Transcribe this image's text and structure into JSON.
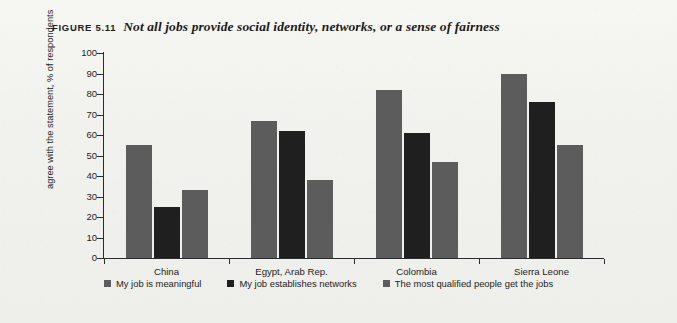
{
  "figure": {
    "label": "FIGURE 5.11",
    "title": "Not all jobs provide social identity, networks, or a sense of fairness"
  },
  "colors": {
    "series_gray": "#5c5c5c",
    "series_black": "#1f1f1f",
    "axis": "#2b2b2b",
    "text": "#1d1d1d",
    "background": "#f1f1ee"
  },
  "chart_data": {
    "type": "bar",
    "title": "Not all jobs provide social identity, networks, or a sense of fairness",
    "xlabel": "",
    "ylabel": "agree with the statement, % of respondents",
    "ylim": [
      0,
      100
    ],
    "ytick_step": 10,
    "yticks": [
      0,
      10,
      20,
      30,
      40,
      50,
      60,
      70,
      80,
      90,
      100
    ],
    "ytick_labels": [
      "0",
      "10",
      "20",
      "30",
      "40",
      "50",
      "60",
      "70",
      "80",
      "90",
      "100"
    ],
    "grid": false,
    "legend_position": "bottom",
    "categories": [
      "China",
      "Egypt, Arab Rep.",
      "Colombia",
      "Sierra Leone"
    ],
    "series": [
      {
        "name": "My job is meaningful",
        "color": "#5c5c5c",
        "values": [
          55,
          67,
          82,
          90
        ]
      },
      {
        "name": "My job establishes networks",
        "color": "#1f1f1f",
        "values": [
          25,
          62,
          61,
          76
        ]
      },
      {
        "name": "The most qualified people get the jobs",
        "color": "#5c5c5c",
        "values": [
          33,
          38,
          47,
          55
        ]
      }
    ]
  }
}
